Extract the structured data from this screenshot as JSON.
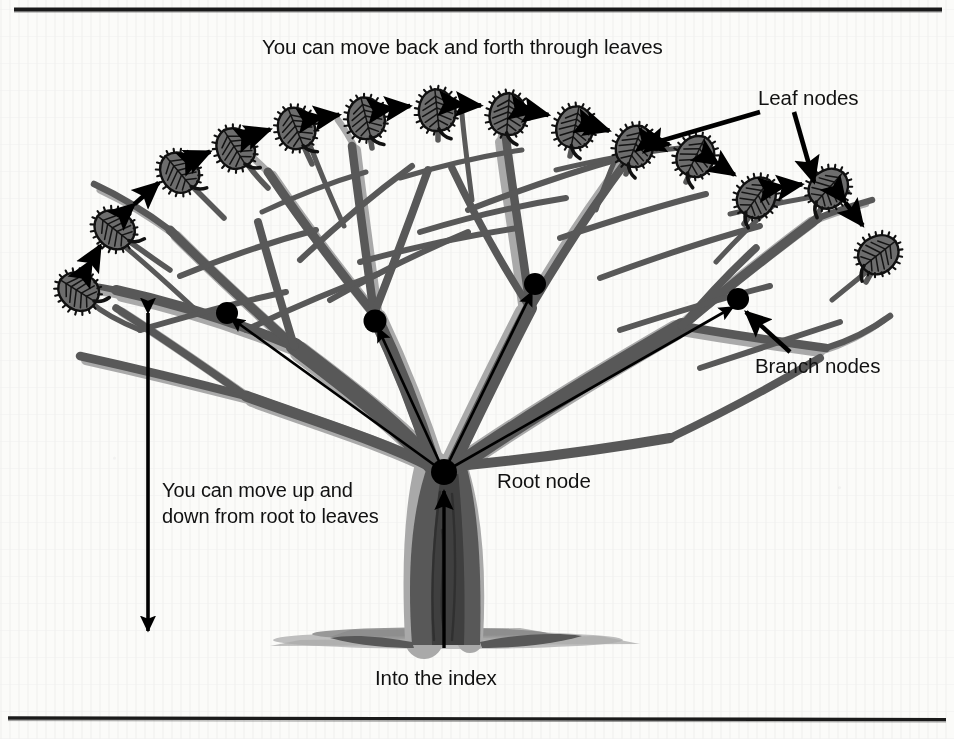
{
  "figure": {
    "background_color": "#fbfbf9",
    "rule_color": "#151515",
    "branch_dark_color": "#585858",
    "branch_light_color": "#a9a9a9",
    "leaf_fill_color": "#6f6f6f",
    "leaf_outline_color": "#111111",
    "node_color": "#000000",
    "arrow_color": "#000000"
  },
  "labels": {
    "top_caption": "You can move back and forth through leaves",
    "leaf_nodes": "Leaf nodes",
    "branch_nodes": "Branch nodes",
    "root_node": "Root node",
    "vertical_caption_line1": "You can move up and",
    "vertical_caption_line2": "down from root to leaves",
    "into_the_index": "Into the index"
  },
  "diagram": {
    "type": "tree-index",
    "root_node": {
      "x": 444,
      "y": 472
    },
    "branch_nodes": [
      {
        "x": 227,
        "y": 313
      },
      {
        "x": 375,
        "y": 321
      },
      {
        "x": 535,
        "y": 284
      },
      {
        "x": 738,
        "y": 299
      }
    ],
    "leaf_nodes": [
      {
        "x": 78,
        "y": 291,
        "rot": -58
      },
      {
        "x": 114,
        "y": 229,
        "rot": -52
      },
      {
        "x": 179,
        "y": 172,
        "rot": -40
      },
      {
        "x": 235,
        "y": 148,
        "rot": -32
      },
      {
        "x": 296,
        "y": 128,
        "rot": -22
      },
      {
        "x": 366,
        "y": 118,
        "rot": -14
      },
      {
        "x": 437,
        "y": 110,
        "rot": -6
      },
      {
        "x": 508,
        "y": 114,
        "rot": 4
      },
      {
        "x": 575,
        "y": 127,
        "rot": 11
      },
      {
        "x": 635,
        "y": 146,
        "rot": 20
      },
      {
        "x": 696,
        "y": 156,
        "rot": 26
      },
      {
        "x": 757,
        "y": 197,
        "rot": 36
      },
      {
        "x": 829,
        "y": 188,
        "rot": 42
      },
      {
        "x": 879,
        "y": 254,
        "rot": 52
      }
    ],
    "leaf_sibling_arrows": 13,
    "root_to_branch_arrows": 4,
    "vertical_arrow": {
      "x": 148,
      "y_top": 313,
      "y_bottom": 631,
      "double_headed": true
    },
    "index_arrow": {
      "x": 444,
      "y_top": 489,
      "y_bottom": 648,
      "points": "up"
    }
  },
  "rules": {
    "top": {
      "y": 9,
      "x_start": 14,
      "x_end": 942
    },
    "bottom": {
      "y": 718,
      "x_start": 8,
      "x_end": 946
    }
  }
}
